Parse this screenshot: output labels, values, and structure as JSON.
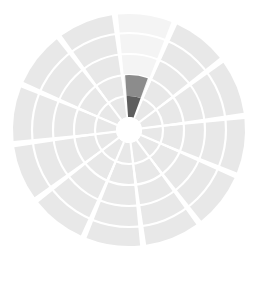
{
  "chart_data": {
    "type": "pie",
    "subtype": "polar-area-rose",
    "title": "",
    "subtitle": "",
    "xlabel": "",
    "ylabel": "",
    "legend": [],
    "annotations": [],
    "grid": true,
    "grid_rings": 5,
    "sector_count": 12,
    "sector_angle_deg": 30,
    "start_angle_deg": -97,
    "center_x": 129,
    "center_y": 130,
    "inner_radius": 13,
    "max_radius": 116,
    "rlim": [
      0,
      5
    ],
    "categories": [
      "S1",
      "S2",
      "S3",
      "S4",
      "S5",
      "S6",
      "S7",
      "S8",
      "S9",
      "S10",
      "S11",
      "S12"
    ],
    "values": [
      5,
      5,
      5,
      5,
      5,
      5,
      5,
      5,
      5,
      5,
      5,
      5
    ],
    "ring_radii": [
      13,
      34,
      55,
      76,
      97,
      116
    ],
    "tick_labels": [],
    "colors": {
      "petal": "#e8e8e8",
      "petal_faint": "#f4f4f4",
      "grid": "#ffffff",
      "background": "#ffffff",
      "hole": "#ffffff",
      "highlight_mid": "#8c8c8c",
      "highlight_dark": "#5e5e5e"
    },
    "series": [
      {
        "name": "base",
        "values": [
          5,
          5,
          5,
          5,
          5,
          5,
          5,
          5,
          5,
          5,
          5,
          5
        ]
      },
      {
        "name": "highlight",
        "sector_index": 0,
        "segments": [
          {
            "ring_from": 1,
            "ring_to": 2,
            "color": "#5e5e5e"
          },
          {
            "ring_from": 2,
            "ring_to": 3,
            "color": "#8c8c8c"
          }
        ]
      }
    ],
    "faint_sectors": [
      0
    ]
  },
  "chart": {
    "caption": ""
  }
}
